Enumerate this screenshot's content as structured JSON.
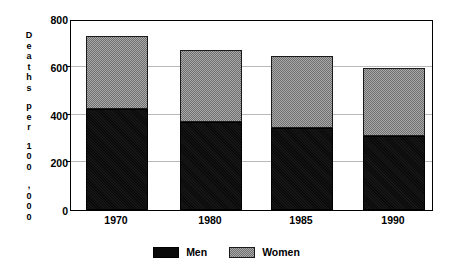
{
  "chart_data": {
    "type": "bar",
    "subtype": "stacked-vertical",
    "title": "",
    "xlabel": "",
    "ylabel": "Deaths per 100,000",
    "ylim": [
      0,
      800
    ],
    "ytick_values": [
      0,
      200,
      400,
      600,
      800
    ],
    "ytick_labels": [
      "0",
      "200",
      "400",
      "600",
      "800"
    ],
    "grid": "horizontal",
    "legend_position": "bottom-center",
    "categories": [
      "1970",
      "1980",
      "1985",
      "1990"
    ],
    "series": [
      {
        "name": "Men",
        "color": "#0a0a0a",
        "values": [
          425,
          370,
          345,
          310
        ]
      },
      {
        "name": "Women",
        "color": "#8d8d8d",
        "values": [
          305,
          300,
          300,
          285
        ]
      }
    ],
    "totals": [
      730,
      670,
      645,
      595
    ]
  },
  "axis_title": {
    "line1": "Deaths",
    "line2": "per",
    "line3": "100",
    "line4": ",000",
    "chars": [
      "D",
      "e",
      "a",
      "t",
      "h",
      "s",
      "p",
      "e",
      "r",
      "1",
      "0",
      "0",
      ",",
      "0",
      "0",
      "0"
    ]
  },
  "legend": {
    "items": [
      {
        "label": "Men",
        "swatch": "solid-black-swatch"
      },
      {
        "label": "Women",
        "swatch": "hatched-gray-swatch"
      }
    ]
  },
  "y_labels": [
    "800",
    "600",
    "400",
    "200",
    "0"
  ],
  "x_labels": [
    "1970",
    "1980",
    "1985",
    "1990"
  ],
  "colors": {
    "men": "#0a0a0a",
    "women": "#8d8d8d",
    "grid": "#b9b9b9",
    "frame": "#000000",
    "background": "#ffffff"
  }
}
